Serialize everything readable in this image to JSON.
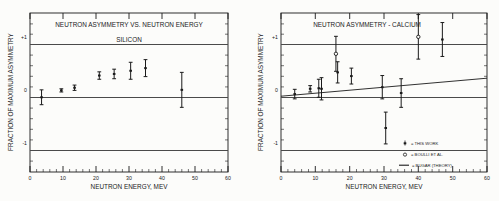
{
  "figure": {
    "background": "#fcfcfa",
    "ink": "#1a1a1a"
  },
  "panels": [
    {
      "id": "silicon",
      "title_line1": "NEUTRON  ASYMMETRY  VS.  NEUTRON  ENERGY",
      "title_line2": "SILICON",
      "ylabel": "FRACTION  OF  MAXIMUM  ASYMMETRY",
      "xlabel": "NEUTRON  ENERGY,  MEV"
    },
    {
      "id": "calcium",
      "title_line1": "NEUTRON  ASYMMETRY  -  CALCIUM",
      "title_line2": "",
      "ylabel": "FRACTION  OF  MAXIMUM  ASYMMETRY",
      "xlabel": "NEUTRON  ENERGY,  MEV",
      "legend": [
        {
          "marker": "errorbar-filled",
          "label": "=  THIS  WORK"
        },
        {
          "marker": "open-circle",
          "label": "=  BOULLI  ET  AL."
        },
        {
          "marker": "line",
          "label": "=  BUGAR  (THEORY)"
        }
      ]
    }
  ],
  "axis": {
    "xticks": [
      0,
      10,
      20,
      30,
      40,
      50,
      60
    ],
    "xticklabels": [
      "0",
      "10",
      "20",
      "30",
      "40",
      "50",
      "60"
    ],
    "xlim": [
      0,
      60
    ],
    "yticks": [
      1,
      0,
      -1
    ],
    "yticklabels": [
      "+1",
      "0",
      "-1"
    ],
    "ylim": [
      -1.55,
      1.45
    ],
    "minor_x_step": 2,
    "minor_y_step": 0.2,
    "grid": "reference-lines-at-+1-0--1"
  },
  "chart_data": [
    {
      "type": "scatter",
      "title": "NEUTRON ASYMMETRY VS. NEUTRON ENERGY — SILICON",
      "xlabel": "NEUTRON ENERGY, MEV",
      "ylabel": "FRACTION OF MAXIMUM ASYMMETRY",
      "xlim": [
        0,
        60
      ],
      "ylim": [
        -1.55,
        1.45
      ],
      "grid": false,
      "legend": "none",
      "series": [
        {
          "name": "THIS WORK",
          "marker": "filled-square-with-errorbar",
          "x": [
            3.5,
            9.5,
            13.5,
            21.0,
            25.5,
            30.5,
            35.0,
            46.0
          ],
          "y": [
            -0.14,
            -0.01,
            0.04,
            0.27,
            0.3,
            0.36,
            0.41,
            0.0
          ],
          "yerr": [
            0.14,
            0.03,
            0.05,
            0.07,
            0.09,
            0.16,
            0.16,
            0.33
          ]
        }
      ]
    },
    {
      "type": "scatter",
      "title": "NEUTRON ASYMMETRY - CALCIUM",
      "xlabel": "NEUTRON ENERGY, MEV",
      "ylabel": "FRACTION OF MAXIMUM ASYMMETRY",
      "xlim": [
        0,
        60
      ],
      "ylim": [
        -1.55,
        1.45
      ],
      "grid": false,
      "legend": "inside-lower-right",
      "series": [
        {
          "name": "THIS WORK",
          "marker": "filled-square-with-errorbar",
          "x": [
            4.0,
            8.5,
            11.0,
            11.8,
            16.5,
            20.5,
            29.5,
            30.5,
            35.0,
            47.0
          ],
          "y": [
            -0.08,
            0.02,
            0.03,
            0.02,
            0.33,
            0.26,
            0.05,
            -0.72,
            -0.06,
            0.95
          ],
          "yerr": [
            0.09,
            0.06,
            0.17,
            0.21,
            0.2,
            0.15,
            0.22,
            0.3,
            0.27,
            0.32
          ]
        },
        {
          "name": "BOULLI ET AL.",
          "marker": "open-circle-with-errorbar",
          "x": [
            16.0,
            40.0
          ],
          "y": [
            0.68,
            1.0
          ],
          "yerr": [
            0.33,
            0.42
          ]
        },
        {
          "name": "BUGAR (THEORY)",
          "marker": "line",
          "x": [
            0,
            60
          ],
          "y": [
            -0.12,
            0.22
          ]
        }
      ]
    }
  ]
}
